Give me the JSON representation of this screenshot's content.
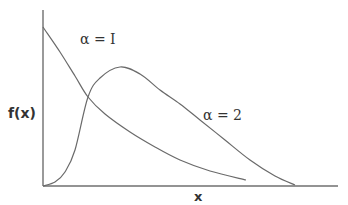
{
  "chart_data": {
    "type": "line",
    "title": "",
    "xlabel": "x",
    "ylabel": "f(x)",
    "grid": false,
    "ticks": false,
    "legend_position": "inline-annotations",
    "series": [
      {
        "name": "α = 1",
        "description": "monotonically decreasing density starting high at x=0",
        "points_px": [
          [
            43,
            27
          ],
          [
            60,
            52
          ],
          [
            75,
            76
          ],
          [
            88,
            97
          ],
          [
            105,
            114
          ],
          [
            130,
            132
          ],
          [
            155,
            147
          ],
          [
            180,
            160
          ],
          [
            210,
            171
          ],
          [
            246,
            180
          ]
        ]
      },
      {
        "name": "α = 2",
        "description": "density starting at 0, rising to a peak then decaying to the axis",
        "points_px": [
          [
            43,
            186
          ],
          [
            55,
            182
          ],
          [
            65,
            172
          ],
          [
            75,
            150
          ],
          [
            88,
            97
          ],
          [
            100,
            78
          ],
          [
            120,
            67
          ],
          [
            140,
            74
          ],
          [
            160,
            90
          ],
          [
            180,
            104
          ],
          [
            200,
            120
          ],
          [
            225,
            140
          ],
          [
            250,
            160
          ],
          [
            275,
            176
          ],
          [
            295,
            185
          ]
        ]
      }
    ]
  },
  "labels": {
    "y_axis": "f(x)",
    "x_axis": "x",
    "series_1": "α = I",
    "series_2": "α =  2"
  },
  "colors": {
    "axis": "#6f6f6f",
    "curve": "#6a6a6a",
    "text": "#333333",
    "background": "#ffffff"
  }
}
